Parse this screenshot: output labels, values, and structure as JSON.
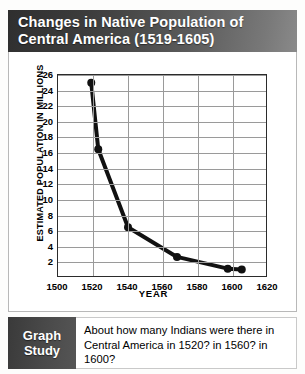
{
  "header": {
    "title_line1": "Changes in Native Population of",
    "title_line2": "Central America (1519-1605)"
  },
  "chart_data": {
    "type": "line",
    "title": "Changes in Native Population of Central America (1519-1605)",
    "xlabel": "YEAR",
    "ylabel": "ESTIMATED POPULATION IN MILLIONS",
    "xlim": [
      1500,
      1620
    ],
    "ylim": [
      0,
      26
    ],
    "xticks": [
      1500,
      1520,
      1540,
      1560,
      1580,
      1600,
      1620
    ],
    "yticks": [
      2,
      4,
      6,
      8,
      10,
      12,
      14,
      16,
      18,
      20,
      22,
      24,
      26
    ],
    "grid": true,
    "legend": "none",
    "marker": "circle",
    "line_color": "#111111",
    "x": [
      1519,
      1523,
      1540,
      1568,
      1597,
      1605
    ],
    "values": [
      25.0,
      16.5,
      6.5,
      2.7,
      1.2,
      1.1
    ],
    "series": [
      {
        "name": "Estimated native population",
        "x": [
          1519,
          1523,
          1540,
          1568,
          1597,
          1605
        ],
        "values": [
          25.0,
          16.5,
          6.5,
          2.7,
          1.2,
          1.1
        ]
      }
    ]
  },
  "footer": {
    "tab_line1": "Graph",
    "tab_line2": "Study",
    "question": "About how many Indians were there in Central America in 1520? in 1560? in 1600?"
  },
  "colors": {
    "header_dark": "#2f2f2f",
    "header_light": "#8a8a8a",
    "grid": "#9a9a9a",
    "axis": "#2b2b2b",
    "series": "#111111"
  }
}
